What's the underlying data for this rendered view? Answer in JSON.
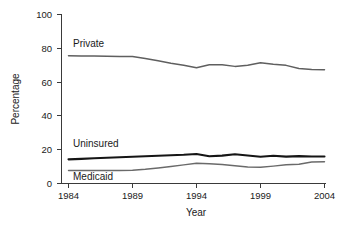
{
  "chart_data": {
    "type": "line",
    "title": "",
    "xlabel": "Year",
    "ylabel": "Percentage",
    "xlim": [
      1984,
      2004
    ],
    "ylim": [
      0,
      100
    ],
    "grid": false,
    "legend_position": "inline-labels",
    "xticks": [
      1984,
      1989,
      1994,
      1999,
      2004
    ],
    "yticks": [
      0,
      20,
      40,
      60,
      80,
      100
    ],
    "x": [
      1984,
      1985,
      1986,
      1987,
      1988,
      1989,
      1990,
      1991,
      1992,
      1993,
      1994,
      1995,
      1996,
      1997,
      1998,
      1999,
      2000,
      2001,
      2002,
      2003,
      2004
    ],
    "series": [
      {
        "name": "Private",
        "color": "#5f5f5f",
        "values": [
          75.6,
          75.5,
          75.4,
          75.3,
          75.2,
          75.1,
          74.0,
          72.6,
          71.2,
          70.0,
          68.5,
          70.3,
          70.2,
          69.3,
          70.0,
          71.5,
          70.6,
          69.9,
          68.0,
          67.4,
          67.3
        ]
      },
      {
        "name": "Uninsured",
        "color": "#151515",
        "values": [
          14.3,
          14.6,
          14.9,
          15.2,
          15.5,
          15.8,
          16.1,
          16.4,
          16.7,
          17.0,
          17.5,
          16.1,
          16.5,
          17.3,
          16.6,
          15.8,
          16.4,
          15.9,
          16.2,
          16.0,
          16.0
        ]
      },
      {
        "name": "Medicaid",
        "color": "#6a6a6a",
        "values": [
          7.7,
          7.7,
          7.7,
          7.7,
          7.7,
          7.8,
          8.4,
          9.2,
          10.1,
          11.0,
          12.0,
          11.7,
          11.2,
          10.5,
          9.8,
          9.6,
          10.3,
          11.1,
          11.4,
          12.7,
          12.9
        ]
      }
    ]
  },
  "axes": {
    "y_title": "Percentage",
    "x_title": "Year",
    "y_tick_labels": [
      "100",
      "80",
      "60",
      "40",
      "20",
      "0"
    ],
    "x_tick_labels": [
      "1984",
      "1989",
      "1994",
      "1999",
      "2004"
    ]
  },
  "series_labels": {
    "private": "Private",
    "uninsured": "Uninsured",
    "medicaid": "Medicaid"
  }
}
